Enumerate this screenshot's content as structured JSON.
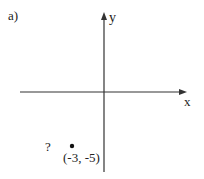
{
  "problem_label": "a)",
  "axes": {
    "x_label": "x",
    "y_label": "y"
  },
  "point": {
    "label": "(-3, -5)",
    "x": -3,
    "y": -5
  },
  "question_mark": "?",
  "colors": {
    "axis": "#333333",
    "text": "#222222",
    "background": "#ffffff"
  }
}
